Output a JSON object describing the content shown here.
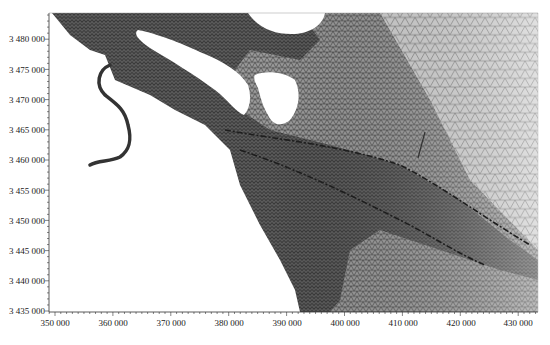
{
  "chart_data": {
    "type": "mesh",
    "title": "",
    "xlabel": "",
    "ylabel": "",
    "xlim": [
      349000,
      436000
    ],
    "ylim": [
      3435000,
      3484500
    ],
    "x_ticks": [
      350000,
      360000,
      370000,
      380000,
      390000,
      400000,
      410000,
      420000,
      430000
    ],
    "x_tick_labels": [
      "350 000",
      "360 000",
      "370 000",
      "380 000",
      "390 000",
      "400 000",
      "410 000",
      "420 000",
      "430 000"
    ],
    "y_ticks": [
      3435000,
      3440000,
      3445000,
      3450000,
      3455000,
      3460000,
      3465000,
      3470000,
      3475000,
      3480000
    ],
    "y_tick_labels": [
      "3 435 000",
      "3 440 000",
      "3 445 000",
      "3 450 000",
      "3 455 000",
      "3 460 000",
      "3 465 000",
      "3 470 000",
      "3 475 000",
      "3 480 000"
    ],
    "grid": false,
    "legend": null,
    "colors": {
      "mesh_dense": "#3a3a3a",
      "mesh_sparse": "#8a8a8a",
      "land": "#ffffff",
      "axis": "#333333"
    }
  }
}
